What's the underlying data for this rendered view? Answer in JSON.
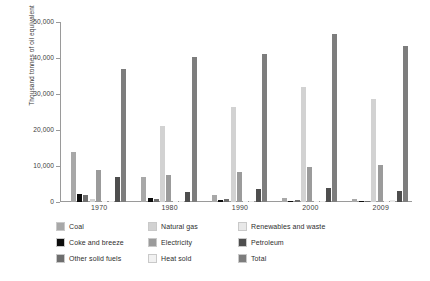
{
  "chart_data": {
    "type": "bar",
    "title": "",
    "xlabel": "",
    "ylabel": "Thousand tonnes of oil equivalent",
    "ylim": [
      0,
      50000
    ],
    "ytick_labels": [
      "0",
      "10,000",
      "20,000",
      "30,000",
      "40,000",
      "50,000"
    ],
    "ytick_values": [
      0,
      10000,
      20000,
      30000,
      40000,
      50000
    ],
    "grid": false,
    "legend_position": "bottom",
    "categories": [
      "1970",
      "1980",
      "1990",
      "2000",
      "2009"
    ],
    "series": [
      {
        "name": "Coal",
        "color": "#a8a8a8",
        "values": [
          14000,
          7000,
          2000,
          1000,
          700
        ]
      },
      {
        "name": "Coke and breeze",
        "color": "#0d0d0d",
        "values": [
          2100,
          1000,
          600,
          300,
          150
        ]
      },
      {
        "name": "Other solid fuels",
        "color": "#6e6e6e",
        "values": [
          2000,
          900,
          900,
          600,
          400
        ]
      },
      {
        "name": "Natural gas",
        "color": "#d2d2d2",
        "values": [
          900,
          21200,
          26300,
          31900,
          28500
        ]
      },
      {
        "name": "Electricity",
        "color": "#9b9b9b",
        "values": [
          8800,
          7400,
          8400,
          9700,
          10400
        ]
      },
      {
        "name": "Heat sold",
        "color": "#f1f1f1",
        "values": [
          0,
          200,
          300,
          400,
          400
        ]
      },
      {
        "name": "Renewables and waste",
        "color": "#e8e8e8",
        "values": [
          0,
          0,
          100,
          200,
          500
        ]
      },
      {
        "name": "Petroleum",
        "color": "#4e4e4e",
        "values": [
          7000,
          2800,
          3700,
          3800,
          3000
        ]
      },
      {
        "name": "Total",
        "color": "#7d7d7d",
        "values": [
          36900,
          40200,
          41000,
          46800,
          43300
        ]
      }
    ]
  },
  "legend": {
    "items": [
      {
        "label": "Coal",
        "color": "#a8a8a8"
      },
      {
        "label": "Natural gas",
        "color": "#d2d2d2"
      },
      {
        "label": "Renewables and waste",
        "color": "#e8e8e8"
      },
      {
        "label": "Coke and breeze",
        "color": "#0d0d0d"
      },
      {
        "label": "Electricity",
        "color": "#9b9b9b"
      },
      {
        "label": "Petroleum",
        "color": "#4e4e4e"
      },
      {
        "label": "Other solid fuels",
        "color": "#6e6e6e"
      },
      {
        "label": "Heat sold",
        "color": "#f1f1f1"
      },
      {
        "label": "Total",
        "color": "#7d7d7d"
      }
    ]
  }
}
